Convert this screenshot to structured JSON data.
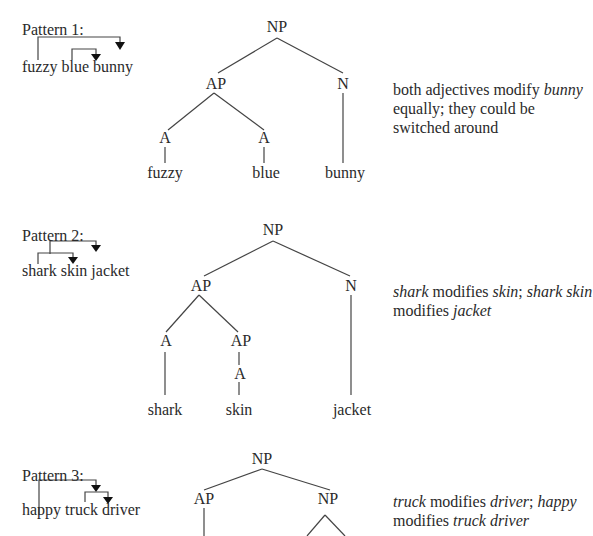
{
  "patterns": [
    {
      "title": "Pattern 1:",
      "phrase": "fuzzy blue bunny",
      "tree": {
        "root": "NP",
        "ap": "AP",
        "n": "N",
        "a1": "A",
        "a2": "A",
        "w1": "fuzzy",
        "w2": "blue",
        "w3": "bunny"
      },
      "description": {
        "p1": "both adjectives modify ",
        "i1": "bunny",
        "p2": " equally; they could be switched around"
      }
    },
    {
      "title": "Pattern 2:",
      "phrase": "shark skin jacket",
      "tree": {
        "root": "NP",
        "ap": "AP",
        "n": "N",
        "a1": "A",
        "ap2": "AP",
        "a2": "A",
        "w1": "shark",
        "w2": "skin",
        "w3": "jacket"
      },
      "description": {
        "i1": "shark",
        "p1": " modifies ",
        "i2": "skin",
        "p2": "; ",
        "i3": "shark skin",
        "p3": " modifies ",
        "i4": "jacket"
      }
    },
    {
      "title": "Pattern 3:",
      "phrase": "happy truck driver",
      "tree": {
        "root": "NP",
        "ap": "AP",
        "np2": "NP"
      },
      "description": {
        "i1": "truck",
        "p1": " modifies ",
        "i2": "driver",
        "p2": "; ",
        "i3": "happy",
        "p3": " modifies ",
        "i4": "truck driver"
      }
    }
  ]
}
